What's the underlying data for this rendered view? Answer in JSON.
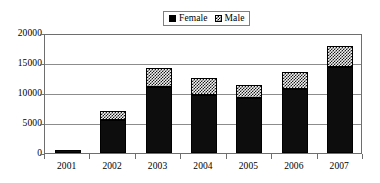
{
  "chart_data": {
    "type": "bar",
    "subtype": "stacked-column",
    "title": "",
    "subtitle": "",
    "xlabel": "",
    "ylabel": "",
    "categories": [
      "2001",
      "2002",
      "2003",
      "2004",
      "2005",
      "2006",
      "2007"
    ],
    "series": [
      {
        "name": "Female",
        "values": [
          500,
          5500,
          11000,
          9600,
          9200,
          10700,
          14300
        ],
        "color": "#000000",
        "fill": "solid-black"
      },
      {
        "name": "Male",
        "values": [
          0,
          1500,
          3200,
          2900,
          2100,
          2800,
          3500
        ],
        "color": "#000000",
        "fill": "checkered-hatch"
      }
    ],
    "totals": [
      500,
      7000,
      14200,
      12500,
      11300,
      13500,
      17800
    ],
    "ylim": [
      0,
      20000
    ],
    "yticks": [
      "0",
      "5000",
      "10000",
      "15000",
      "20000"
    ],
    "ytick_values": [
      0,
      5000,
      10000,
      15000,
      20000
    ],
    "grid": true,
    "grid_axis": "y",
    "legend_position": "top-center",
    "plot_border": true
  },
  "legend": {
    "entries": [
      {
        "label": "Female",
        "swatch": "solid-black-swatch"
      },
      {
        "label": "Male",
        "swatch": "checkered-swatch"
      }
    ]
  },
  "colors": {
    "female": "#000000",
    "male_hatch": "#1a1a1a",
    "male_background": "#f2f2f2",
    "gridline": "#8c8c8c",
    "axis": "#6e6e6e",
    "plot_background": "#ffffff"
  }
}
